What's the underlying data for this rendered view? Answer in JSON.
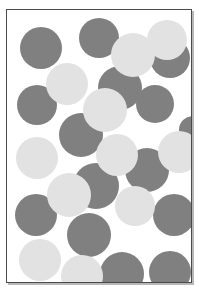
{
  "figure": {
    "title": "",
    "width": 199,
    "height": 297,
    "background_color": "#ffffff"
  },
  "frame": {
    "name": "plot-frame",
    "x": 6,
    "y": 9,
    "width": 186,
    "height": 274,
    "border_color": "#4a4a4a",
    "border_width": 1,
    "fill_color": "#ffffff",
    "shadow_color": "#b8b8b8",
    "shadow_offset": 2
  },
  "palette": {
    "dark": "#808080",
    "light": "#e2e2e2",
    "dark_label": "dark-gray-circle",
    "light_label": "light-gray-circle"
  },
  "chart_data": {
    "type": "scatter",
    "title": "",
    "subtitle": "",
    "xlabel": "",
    "ylabel": "",
    "xlim": [
      0,
      186
    ],
    "ylim": [
      0,
      274
    ],
    "grid": false,
    "legend": false,
    "marker": "circle",
    "categories": [
      "dark",
      "light"
    ],
    "series": [
      {
        "name": "dark",
        "color": "#808080",
        "count": 15,
        "points": [
          {
            "cx": 34,
            "cy": 38,
            "r": 21
          },
          {
            "cx": 92,
            "cy": 28,
            "r": 20
          },
          {
            "cx": 163,
            "cy": 48,
            "r": 20
          },
          {
            "cx": 30,
            "cy": 95,
            "r": 20
          },
          {
            "cx": 113,
            "cy": 78,
            "r": 22
          },
          {
            "cx": 148,
            "cy": 94,
            "r": 19
          },
          {
            "cx": 74,
            "cy": 125,
            "r": 22
          },
          {
            "cx": 140,
            "cy": 160,
            "r": 22
          },
          {
            "cx": 89,
            "cy": 176,
            "r": 23
          },
          {
            "cx": 29,
            "cy": 205,
            "r": 21
          },
          {
            "cx": 167,
            "cy": 205,
            "r": 21
          },
          {
            "cx": 82,
            "cy": 225,
            "r": 22
          },
          {
            "cx": 115,
            "cy": 264,
            "r": 22
          },
          {
            "cx": 163,
            "cy": 262,
            "r": 21
          },
          {
            "cx": 186,
            "cy": 120,
            "r": 14
          }
        ]
      },
      {
        "name": "light",
        "color": "#e2e2e2",
        "count": 11,
        "points": [
          {
            "cx": 60,
            "cy": 74,
            "r": 21
          },
          {
            "cx": 126,
            "cy": 45,
            "r": 22
          },
          {
            "cx": 160,
            "cy": 30,
            "r": 20
          },
          {
            "cx": 98,
            "cy": 100,
            "r": 22
          },
          {
            "cx": 30,
            "cy": 148,
            "r": 21
          },
          {
            "cx": 110,
            "cy": 145,
            "r": 21
          },
          {
            "cx": 172,
            "cy": 142,
            "r": 21
          },
          {
            "cx": 62,
            "cy": 185,
            "r": 22
          },
          {
            "cx": 128,
            "cy": 196,
            "r": 20
          },
          {
            "cx": 33,
            "cy": 250,
            "r": 21
          },
          {
            "cx": 75,
            "cy": 266,
            "r": 21
          }
        ]
      }
    ]
  }
}
